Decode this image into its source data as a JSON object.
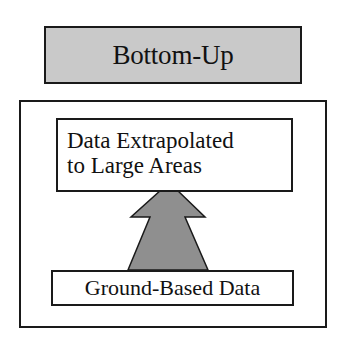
{
  "diagram": {
    "title": "Bottom-Up",
    "top_box": {
      "line1": "Data Extrapolated",
      "line2": "to Large Areas"
    },
    "bottom_box": {
      "label": "Ground-Based Data"
    },
    "arrow": {
      "direction": "up",
      "from": "Ground-Based Data",
      "to": "Data Extrapolated to Large Areas"
    },
    "colors": {
      "header_fill": "#c9c9c9",
      "arrow_fill": "#8f8f8f",
      "stroke": "#1a1a1a",
      "background": "#ffffff"
    }
  }
}
